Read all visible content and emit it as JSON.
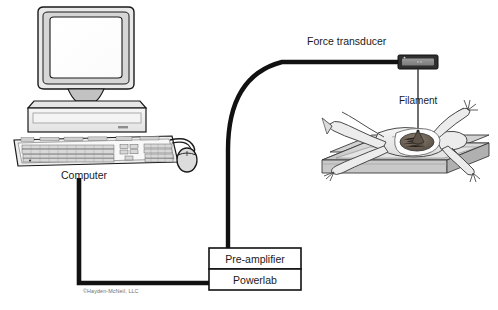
{
  "figure": {
    "background_color": "#ffffff",
    "width": 498,
    "height": 310
  },
  "labels": {
    "computer": "Computer",
    "force_transducer": "Force transducer",
    "filament": "Filament",
    "pre_amplifier": "Pre-amplifier",
    "powerlab": "Powerlab",
    "copyright": "©Hayden-McNeil, LLC"
  },
  "components": {
    "computer": {
      "name": "Desktop computer with CRT monitor, horizontal case, keyboard and mouse",
      "outline_color": "#1a1a1a",
      "fill_color": "#f2f2f2",
      "shade_color": "#c9c9c9"
    },
    "force_transducer": {
      "name": "Force transducer block",
      "fill_color": "#3a3a3a",
      "inner_color": "#8f8f8f"
    },
    "filament": {
      "name": "Filament thread from transducer to muscle",
      "color": "#3f3f3f"
    },
    "specimen": {
      "name": "Dissected frog pinned on dissecting tray",
      "body_color": "#efefef",
      "tray_top_color": "#cfcfcf",
      "tray_side_color": "#b4b4b4",
      "muscle_color": "#6e6256"
    },
    "pre_amplifier": {
      "name": "Pre-amplifier box",
      "fill_color": "#ffffff",
      "border_color": "#111111"
    },
    "powerlab": {
      "name": "Powerlab box",
      "fill_color": "#ffffff",
      "border_color": "#111111"
    }
  },
  "cables": [
    {
      "name": "transducer-to-preamplifier-cable",
      "from": "Force transducer",
      "to": "Pre-amplifier",
      "style": "thick curved arc",
      "color": "#111111"
    },
    {
      "name": "computer-to-powerlab-cable",
      "from": "Computer",
      "to": "Powerlab",
      "style": "right-angle elbow",
      "color": "#111111"
    },
    {
      "name": "mouse-cable",
      "from": "Mouse",
      "to": "Keyboard",
      "style": "curved",
      "color": "#1a1a1a"
    }
  ]
}
